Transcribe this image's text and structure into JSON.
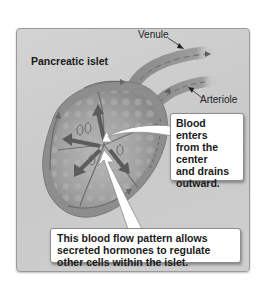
{
  "diagram": {
    "title": "Pancreatic islet",
    "labels": {
      "venule": "Venule",
      "arteriole": "Arteriole"
    },
    "callouts": [
      {
        "id": "blood-enters",
        "lines": [
          "Blood enters",
          "from the",
          "center",
          "and drains",
          "outward."
        ]
      },
      {
        "id": "flow-pattern",
        "lines": [
          "This blood flow pattern allows",
          "secreted hormones to regulate",
          "other cells within the islet."
        ]
      }
    ],
    "colors": {
      "panel_bg": "#cfcfcf",
      "islet_body": "#8a8a8a",
      "islet_inner": "#a6a6a6",
      "vessel": "#8e8e8e",
      "arrow_dark": "#5a5a5a",
      "callout_bg": "#ffffff",
      "text": "#1a1a1a"
    }
  }
}
